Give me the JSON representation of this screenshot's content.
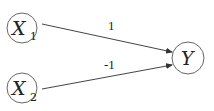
{
  "diagram": {
    "type": "directed-graph",
    "nodes": [
      {
        "id": "X1",
        "label": "X",
        "subscript": "1"
      },
      {
        "id": "X2",
        "label": "X",
        "subscript": "2"
      },
      {
        "id": "Y",
        "label": "Y"
      }
    ],
    "edges": [
      {
        "from": "X1",
        "to": "Y",
        "weight": "1"
      },
      {
        "from": "X2",
        "to": "Y",
        "weight": "-1"
      }
    ],
    "colors": {
      "stroke": "#444444",
      "text": "#222222",
      "background": "#ffffff"
    }
  }
}
